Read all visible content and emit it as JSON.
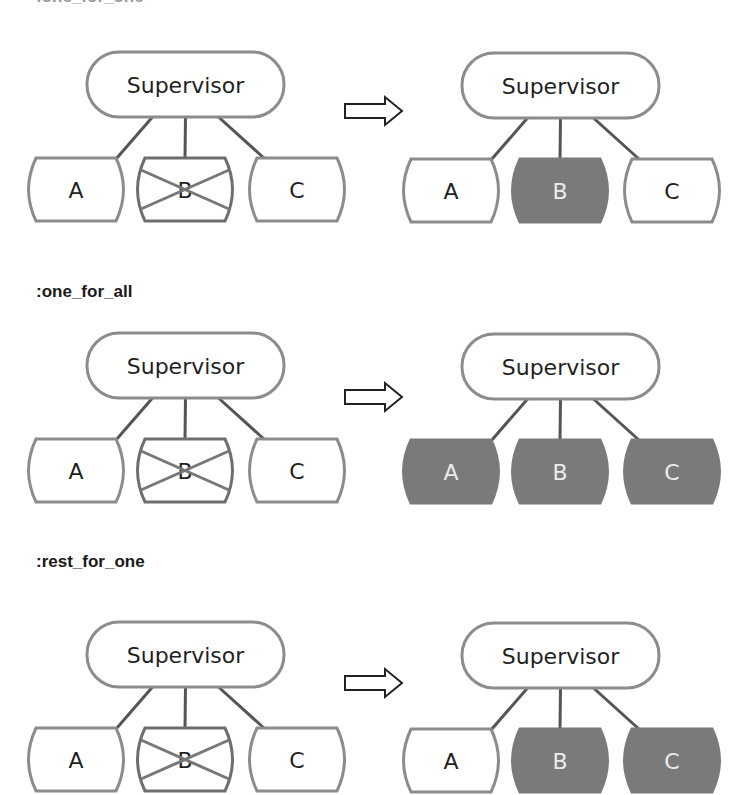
{
  "top_cutoff_label": ":one_for_one",
  "colors": {
    "border": "#8c8c8c",
    "connector": "#555555",
    "text": "#1f1f1f",
    "restarted_fill": "#7a7a7a",
    "restarted_text": "#ececec",
    "crossed_line": "#777777",
    "arrow_stroke": "#222222"
  },
  "rows": [
    {
      "strategy": ":one_for_one",
      "heading_visible": false,
      "before": {
        "supervisor": "Supervisor",
        "children": [
          {
            "label": "A",
            "state": "normal"
          },
          {
            "label": "B",
            "state": "crashed"
          },
          {
            "label": "C",
            "state": "normal"
          }
        ]
      },
      "after": {
        "supervisor": "Supervisor",
        "children": [
          {
            "label": "A",
            "state": "normal"
          },
          {
            "label": "B",
            "state": "restarted"
          },
          {
            "label": "C",
            "state": "normal"
          }
        ]
      }
    },
    {
      "strategy": ":one_for_all",
      "heading_visible": true,
      "before": {
        "supervisor": "Supervisor",
        "children": [
          {
            "label": "A",
            "state": "normal"
          },
          {
            "label": "B",
            "state": "crashed"
          },
          {
            "label": "C",
            "state": "normal"
          }
        ]
      },
      "after": {
        "supervisor": "Supervisor",
        "children": [
          {
            "label": "A",
            "state": "restarted"
          },
          {
            "label": "B",
            "state": "restarted"
          },
          {
            "label": "C",
            "state": "restarted"
          }
        ]
      }
    },
    {
      "strategy": ":rest_for_one",
      "heading_visible": true,
      "before": {
        "supervisor": "Supervisor",
        "children": [
          {
            "label": "A",
            "state": "normal"
          },
          {
            "label": "B",
            "state": "crashed"
          },
          {
            "label": "C",
            "state": "normal"
          }
        ]
      },
      "after": {
        "supervisor": "Supervisor",
        "children": [
          {
            "label": "A",
            "state": "normal"
          },
          {
            "label": "B",
            "state": "restarted"
          },
          {
            "label": "C",
            "state": "restarted"
          }
        ]
      }
    }
  ]
}
